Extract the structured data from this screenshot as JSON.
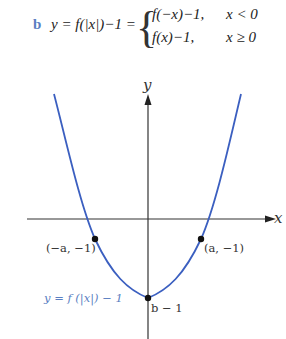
{
  "equation": {
    "part_label": "b",
    "lhs": "y = f(|x|)−1 =",
    "cases": [
      {
        "expr": "f(−x)−1,",
        "condition": "x < 0"
      },
      {
        "expr": "f(x)−1,",
        "condition": "x ≥ 0"
      }
    ]
  },
  "graph": {
    "x_axis_label": "x",
    "y_axis_label": "y",
    "curve_label": "y = f (|x|) − 1",
    "curve_color": "#3b5fc0",
    "points": [
      {
        "label": "(−a, −1)"
      },
      {
        "label": "(a, −1)"
      },
      {
        "label": "b − 1"
      }
    ]
  }
}
